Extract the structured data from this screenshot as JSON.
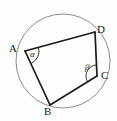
{
  "figure": {
    "kind": "circle-inscribed-quadrilateral-diagram",
    "canvas": {
      "width": 117,
      "height": 121
    },
    "background_color": "#fdfdfc",
    "stroke_color": "#1a1a1a",
    "circle_color": "#8d8d8d",
    "circle": {
      "cx": 63,
      "cy": 61,
      "r": 47
    },
    "vertices": [
      {
        "id": "A",
        "label": "A",
        "x": 25,
        "y": 51,
        "label_x": 9,
        "label_y": 43
      },
      {
        "id": "B",
        "label": "B",
        "x": 50,
        "y": 105,
        "label_x": 44,
        "label_y": 106
      },
      {
        "id": "C",
        "label": "C",
        "x": 97,
        "y": 76,
        "label_x": 101,
        "label_y": 70
      },
      {
        "id": "D",
        "label": "D",
        "x": 95,
        "y": 32,
        "label_x": 97,
        "label_y": 24
      }
    ],
    "edges": [
      {
        "id": "AD",
        "from": "A",
        "to": "D"
      },
      {
        "id": "DC",
        "from": "D",
        "to": "C"
      },
      {
        "id": "CB",
        "from": "C",
        "to": "B"
      },
      {
        "id": "BA",
        "from": "B",
        "to": "A"
      }
    ],
    "angles": [
      {
        "id": "alpha",
        "label": "α",
        "at_vertex": "A",
        "label_x": 30,
        "label_y": 50
      },
      {
        "id": "beta",
        "label": "β",
        "at_vertex": "C",
        "label_x": 85,
        "label_y": 63
      }
    ]
  }
}
